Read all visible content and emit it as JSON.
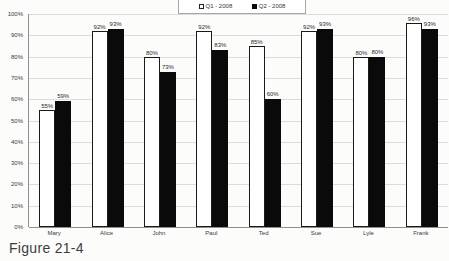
{
  "figure_caption": "Figure 21-4",
  "colors": {
    "q1_fill": "#ffffff",
    "q2_fill": "#0a0a0a",
    "bar_border": "#1a1a1a",
    "gridline": "#dcdcdc",
    "axis": "#8f8f8f",
    "text": "#2b2b2b",
    "background": "#fcfcfb"
  },
  "chart_data": {
    "type": "bar",
    "categories": [
      "Mary",
      "Alice",
      "John",
      "Paul",
      "Ted",
      "Sue",
      "Lyle",
      "Frank"
    ],
    "series": [
      {
        "name": "Q1 - 2008",
        "values": [
          55,
          92,
          80,
          92,
          85,
          92,
          80,
          96
        ]
      },
      {
        "name": "Q2 - 2008",
        "values": [
          59,
          93,
          73,
          83,
          60,
          93,
          80,
          93
        ]
      }
    ],
    "title": "",
    "xlabel": "",
    "ylabel": "",
    "ylim": [
      0,
      100
    ],
    "ytick_step": 10,
    "ytick_labels": [
      "0%",
      "10%",
      "20%",
      "30%",
      "40%",
      "50%",
      "60%",
      "70%",
      "80%",
      "90%",
      "100%"
    ],
    "value_label_suffix": "%",
    "grid": true,
    "legend_position": "top-center"
  }
}
